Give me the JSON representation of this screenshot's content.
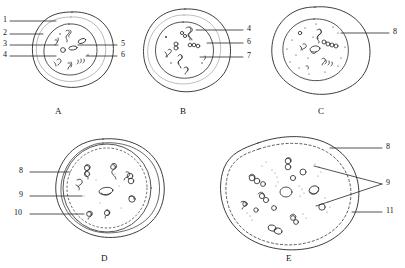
{
  "figure": {
    "ink_color": "#2b2724",
    "background_color": "#ffffff",
    "panels": [
      {
        "id": "A",
        "caption": "A",
        "labels": [
          {
            "num": "1",
            "side": "left"
          },
          {
            "num": "2",
            "side": "left"
          },
          {
            "num": "3",
            "side": "left"
          },
          {
            "num": "4",
            "side": "left"
          },
          {
            "num": "5",
            "side": "right"
          },
          {
            "num": "6",
            "side": "right"
          }
        ]
      },
      {
        "id": "B",
        "caption": "B",
        "labels": [
          {
            "num": "4",
            "side": "right"
          },
          {
            "num": "6",
            "side": "right"
          },
          {
            "num": "7",
            "side": "right"
          }
        ]
      },
      {
        "id": "C",
        "caption": "C",
        "labels": [
          {
            "num": "8",
            "side": "right"
          }
        ]
      },
      {
        "id": "D",
        "caption": "D",
        "labels": [
          {
            "num": "8",
            "side": "left"
          },
          {
            "num": "9",
            "side": "left"
          },
          {
            "num": "10",
            "side": "left"
          }
        ]
      },
      {
        "id": "E",
        "caption": "E",
        "labels": [
          {
            "num": "8",
            "side": "right"
          },
          {
            "num": "9",
            "side": "right"
          },
          {
            "num": "11",
            "side": "right"
          }
        ]
      }
    ]
  }
}
